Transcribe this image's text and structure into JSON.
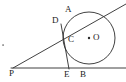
{
  "figure": {
    "kind": "geometry-diagram",
    "width": 126,
    "height": 82,
    "background_color": "#ffffff",
    "stroke_color": "#2b2b2b",
    "label_color": "#1a1a1a"
  },
  "labels": {
    "A": "A",
    "B": "B",
    "C": "C",
    "D": "D",
    "E": "E",
    "O": "O",
    "P": "P"
  },
  "points": [
    {
      "id": "A",
      "label": "A",
      "x": 73,
      "y": 17,
      "label_x": 65,
      "label_y": 5,
      "role": "tangency-point-upper-ray"
    },
    {
      "id": "D",
      "label": "D",
      "x": 61,
      "y": 25,
      "label_x": 52,
      "label_y": 16,
      "role": "point-on-upper-ray"
    },
    {
      "id": "C",
      "label": "C",
      "x": 66,
      "y": 43,
      "label_x": 68,
      "label_y": 35,
      "role": "tangency-point-segment-DE"
    },
    {
      "id": "O",
      "label": "O",
      "x": 89,
      "y": 38,
      "label_x": 93,
      "label_y": 33,
      "role": "circle-center"
    },
    {
      "id": "P",
      "label": "P",
      "x": 13,
      "y": 68,
      "label_x": 9,
      "label_y": 69,
      "role": "external-vertex"
    },
    {
      "id": "E",
      "label": "E",
      "x": 68,
      "y": 68,
      "label_x": 64,
      "label_y": 70,
      "role": "point-on-baseline"
    },
    {
      "id": "B",
      "label": "B",
      "x": 89,
      "y": 68,
      "label_x": 80,
      "label_y": 70,
      "role": "tangency-point-baseline"
    }
  ],
  "circle": {
    "center_x": 89,
    "center_y": 38,
    "radius": 26,
    "center_dot_radius": 1.2
  },
  "segments": [
    {
      "id": "upper-tangent-ray",
      "from_x": 13,
      "from_y": 68,
      "to_x": 126,
      "to_y": 4,
      "name": "ray-P-through-A"
    },
    {
      "id": "baseline-tangent-ray",
      "from_x": 11,
      "from_y": 68,
      "to_x": 126,
      "to_y": 68,
      "name": "ray-P-through-B"
    },
    {
      "id": "tangent-segment-DE",
      "from_x": 61,
      "from_y": 24,
      "to_x": 69,
      "to_y": 69,
      "name": "segment-D-to-E"
    }
  ],
  "marks": [
    {
      "id": "stray-dot",
      "x": 3,
      "y": 45,
      "w": 2,
      "h": 2,
      "name": "stray-speck"
    }
  ]
}
